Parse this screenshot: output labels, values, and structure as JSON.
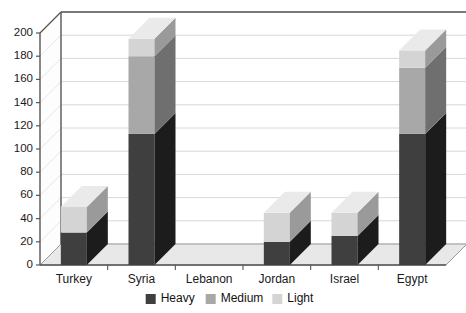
{
  "chart_data": {
    "type": "bar",
    "subtype": "stacked-3d-column",
    "title": "",
    "xlabel": "",
    "ylabel": "",
    "categories": [
      "Turkey",
      "Syria",
      "Lebanon",
      "Jordan",
      "Israel",
      "Egypt"
    ],
    "series": [
      {
        "name": "Heavy",
        "color": "#3f3f3f",
        "values": [
          28,
          113,
          0,
          20,
          25,
          113
        ]
      },
      {
        "name": "Medium",
        "color": "#a8a8a8",
        "values": [
          0,
          67,
          0,
          0,
          0,
          57
        ]
      },
      {
        "name": "Light",
        "color": "#d4d4d4",
        "values": [
          22,
          15,
          0,
          25,
          20,
          15
        ]
      }
    ],
    "totals": [
      50,
      195,
      0,
      45,
      45,
      185
    ],
    "ylim": [
      0,
      200
    ],
    "ytick_step": 20,
    "yticks": [
      "0",
      "20",
      "40",
      "60",
      "80",
      "100",
      "120",
      "140",
      "160",
      "180",
      "200"
    ],
    "grid": true,
    "grid_axis": "y",
    "legend_position": "bottom",
    "legend_entries": [
      "Heavy",
      "Medium",
      "Light"
    ]
  },
  "colors": {
    "heavy": "#3f3f3f",
    "medium": "#a8a8a8",
    "light": "#d4d4d4",
    "heavy_side": "#1c1c1c",
    "medium_side": "#6f6f6f",
    "light_side": "#9a9a9a",
    "heavy_top": "#585858",
    "medium_top": "#c2c2c2",
    "light_top": "#eaeaea",
    "floor": "#e8e8e8",
    "wall": "#ffffff",
    "gridline": "#d8d8d8",
    "axis": "#555555",
    "text": "#1a1a1a"
  }
}
